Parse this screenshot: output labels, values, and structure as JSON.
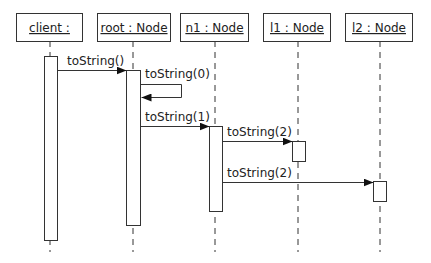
{
  "diagram": {
    "type": "uml-sequence",
    "objects": [
      {
        "id": "client",
        "label": "client :",
        "box": [
          16,
          13,
          66,
          28
        ],
        "lifeline_x": 50
      },
      {
        "id": "root",
        "label": "root : Node",
        "box": [
          97,
          13,
          73,
          28
        ],
        "lifeline_x": 133
      },
      {
        "id": "n1",
        "label": "n1 : Node",
        "box": [
          180,
          13,
          68,
          28
        ],
        "lifeline_x": 215
      },
      {
        "id": "l1",
        "label": "l1 : Node",
        "box": [
          263,
          13,
          67,
          28
        ],
        "lifeline_x": 298
      },
      {
        "id": "l2",
        "label": "l2 : Node",
        "box": [
          345,
          13,
          67,
          28
        ],
        "lifeline_x": 380
      }
    ],
    "messages": [
      {
        "from": "client",
        "to": "root",
        "label": "toString()"
      },
      {
        "from": "root",
        "to": "root",
        "label": "toString(0)",
        "self": true
      },
      {
        "from": "root",
        "to": "n1",
        "label": "toString(1)"
      },
      {
        "from": "n1",
        "to": "l1",
        "label": "toString(2)"
      },
      {
        "from": "n1",
        "to": "l2",
        "label": "toString(2)"
      }
    ]
  }
}
